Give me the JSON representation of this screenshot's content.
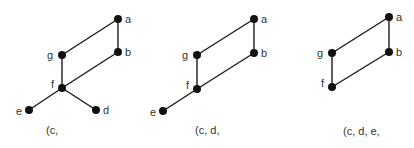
{
  "panels": [
    {
      "caption": "(c,",
      "nodes": {
        "a": "a",
        "b": "b",
        "g": "g",
        "f": "f",
        "e": "e",
        "d": "d"
      }
    },
    {
      "caption": "(c, d,",
      "nodes": {
        "a": "a",
        "b": "b",
        "g": "g",
        "f": "f",
        "e": "e"
      }
    },
    {
      "caption": "(c, d, e,",
      "nodes": {
        "a": "a",
        "b": "b",
        "g": "g",
        "f": "f"
      }
    }
  ]
}
